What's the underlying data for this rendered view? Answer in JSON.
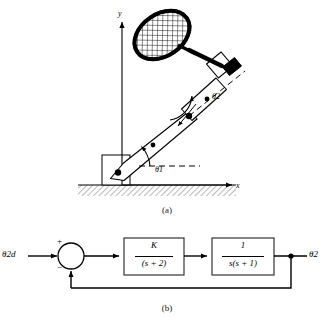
{
  "figure": {
    "panel_a": {
      "caption": "(a)",
      "axes": {
        "y_label": "y",
        "x_label": "x"
      },
      "angles": [
        {
          "name": "theta1",
          "label": "θ1"
        },
        {
          "name": "theta2",
          "label": "θ2"
        }
      ],
      "objects": [
        "tennis-racket",
        "upper-link",
        "lower-link",
        "base-block",
        "ground-hatching"
      ]
    },
    "panel_b": {
      "caption": "(b)",
      "input_label": "θ2d",
      "output_label": "θ2",
      "summing_junction": {
        "plus": "+",
        "minus": "−"
      },
      "blocks": [
        {
          "name": "controller",
          "numerator": "K",
          "denominator": "(s + 2)"
        },
        {
          "name": "plant",
          "numerator": "1",
          "denominator": "s(s + 1)"
        }
      ]
    }
  },
  "colors": {
    "line": "#000000",
    "background": "#ffffff",
    "hatch": "#555555",
    "block_stroke": "#333333"
  }
}
